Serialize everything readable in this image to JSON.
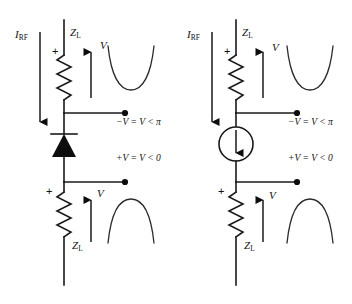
{
  "figure": {
    "background_color": "#ffffff",
    "line_color": "#1a1a1a"
  },
  "circuits": [
    {
      "id": "left",
      "device": "diode",
      "device_icon": "diode-symbol",
      "source_label": "I",
      "source_sub": "RF",
      "upper_z_label": "Z",
      "upper_z_sub": "L",
      "lower_z_label": "Z",
      "lower_z_sub": "L",
      "upper_polarity": "+",
      "lower_polarity": "+",
      "upper_v_label": "V",
      "lower_v_label": "V",
      "upper_node_text": "−V = V < π",
      "lower_node_text": "+V = V < 0",
      "upper_waveform": "valley",
      "lower_waveform": "peak"
    },
    {
      "id": "right",
      "device": "current-source",
      "device_icon": "current-source-symbol",
      "source_label": "I",
      "source_sub": "RF",
      "upper_z_label": "Z",
      "upper_z_sub": "L",
      "lower_z_label": "Z",
      "lower_z_sub": "L",
      "upper_polarity": "+",
      "lower_polarity": "+",
      "upper_v_label": "V",
      "lower_v_label": "V",
      "upper_node_text": "−V = V < π",
      "lower_node_text": "+V = V < 0",
      "upper_waveform": "valley",
      "lower_waveform": "peak"
    }
  ]
}
